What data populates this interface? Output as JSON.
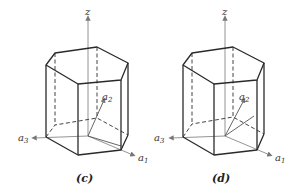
{
  "figures": [
    {
      "id": "c",
      "caption": "(c)",
      "axis_labels": {
        "z": "z",
        "a1": "a",
        "a1_sub": "1",
        "a2": "a",
        "a2_sub": "2",
        "a3": "a",
        "a3_sub": "3"
      }
    },
    {
      "id": "d",
      "caption": "(d)",
      "axis_labels": {
        "z": "z",
        "a1": "a",
        "a1_sub": "1",
        "a2": "a",
        "a2_sub": "2",
        "a3": "a",
        "a3_sub": "3"
      }
    }
  ],
  "colors": {
    "edge": "#2a2a2a",
    "axis": "#888888",
    "background": "#ffffff"
  }
}
